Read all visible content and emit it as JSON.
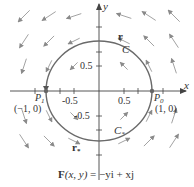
{
  "figure": {
    "axes": {
      "x_label": "x",
      "y_label": "y",
      "x_ticks": [
        "-0.5",
        "0.5"
      ],
      "y_ticks": [
        "0.5",
        "-0.5"
      ],
      "range": [
        -1.8,
        1.8
      ]
    },
    "curve": {
      "label": "C",
      "label_lower": "C",
      "label_lower_sub": "*",
      "type": "unit circle",
      "center": [
        0,
        0
      ],
      "radius": 1
    },
    "vectors": {
      "upper": "r",
      "lower": "r",
      "lower_sub": "*"
    },
    "points": {
      "p0": {
        "name": "P",
        "sub": "0",
        "coords": "(1, 0)"
      },
      "p1": {
        "name": "P",
        "sub": "1",
        "coords": "(−1, 0)"
      }
    },
    "caption": {
      "lhs": "F",
      "args": "(x, y)",
      "rhs": " = −yi + xj"
    },
    "colors": {
      "axis": "#444444",
      "circle": "#6a6a6a",
      "arrow": "#8a8a8a",
      "text": "#333333"
    }
  }
}
